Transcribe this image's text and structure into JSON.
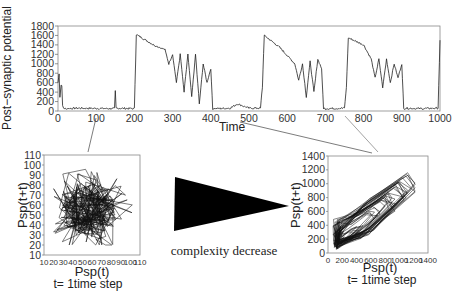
{
  "chart_data": [
    {
      "type": "line",
      "title": "",
      "xlabel": "Time",
      "ylabel": "Post−synaptic potential",
      "xlim": [
        0,
        1000
      ],
      "ylim": [
        0,
        1800
      ],
      "xticks": [
        0,
        100,
        200,
        300,
        400,
        500,
        600,
        700,
        800,
        900,
        1000
      ],
      "yticks": [
        0,
        200,
        400,
        600,
        800,
        1000,
        1200,
        1400,
        1600,
        1800
      ],
      "grid": false,
      "series": [
        {
          "name": "Post-synaptic potential",
          "x": [
            0,
            3,
            5,
            8,
            10,
            12,
            15,
            20,
            50,
            100,
            148,
            150,
            152,
            200,
            205,
            250,
            280,
            290,
            300,
            310,
            320,
            330,
            340,
            350,
            360,
            370,
            380,
            390,
            400,
            405,
            410,
            450,
            470,
            500,
            530,
            535,
            540,
            580,
            620,
            630,
            640,
            650,
            660,
            670,
            680,
            690,
            695,
            700,
            750,
            755,
            760,
            800,
            820,
            830,
            840,
            850,
            860,
            870,
            880,
            890,
            900,
            905,
            910,
            950,
            995,
            1000
          ],
          "values": [
            600,
            800,
            300,
            550,
            550,
            100,
            60,
            50,
            60,
            55,
            50,
            420,
            60,
            50,
            1620,
            1400,
            1300,
            1000,
            1200,
            600,
            1200,
            400,
            1200,
            300,
            1200,
            150,
            1000,
            600,
            900,
            50,
            50,
            60,
            150,
            60,
            60,
            500,
            1600,
            1350,
            1000,
            650,
            1000,
            300,
            1050,
            400,
            1100,
            900,
            60,
            50,
            60,
            500,
            1550,
            1400,
            1100,
            700,
            1100,
            500,
            1100,
            600,
            1000,
            700,
            1000,
            50,
            60,
            50,
            60,
            1500
          ]
        }
      ]
    },
    {
      "type": "line",
      "subtype": "phase-portrait",
      "xlabel": "Psp(t)",
      "ylabel": "Psp(t+t)",
      "caption": "t= 1time step",
      "xlim": [
        10,
        110
      ],
      "ylim": [
        10,
        110
      ],
      "xticks": [
        10,
        20,
        30,
        40,
        50,
        60,
        70,
        80,
        90,
        100,
        110
      ],
      "yticks": [
        10,
        20,
        30,
        40,
        50,
        60,
        70,
        80,
        90,
        100,
        110
      ],
      "description": "dense tangled trajectory centered near (55,55), spanning ~20-100 on both axes"
    },
    {
      "type": "line",
      "subtype": "phase-portrait",
      "xlabel": "Psp(t)",
      "ylabel": "Psp(t+t)",
      "caption": "t= 1time step",
      "xlim": [
        0,
        1400
      ],
      "ylim": [
        0,
        1400
      ],
      "xticks": [
        0,
        200,
        400,
        600,
        800,
        1000,
        1200,
        1400
      ],
      "yticks": [
        0,
        200,
        400,
        600,
        800,
        1000,
        1200,
        1400
      ],
      "description": "looping trajectories forming a wedge from (50,50) to (1200,1200), attractor structure"
    }
  ],
  "annotation": {
    "arrow_label": "complexity decrease"
  },
  "top": {
    "ylabel": "Post−synaptic potential",
    "xlabel": "Time",
    "yticks": [
      "0",
      "200",
      "400",
      "600",
      "800",
      "1000",
      "1200",
      "1400",
      "1600",
      "1800"
    ],
    "xticks": [
      "0",
      "100",
      "200",
      "300",
      "400",
      "500",
      "600",
      "700",
      "800",
      "900",
      "1000"
    ]
  },
  "left": {
    "ylabel": "Psp(t+t)",
    "xlabel": "Psp(t)",
    "caption": "t= 1time step",
    "yticks": [
      "10",
      "20",
      "30",
      "40",
      "50",
      "60",
      "70",
      "80",
      "90",
      "100",
      "110"
    ],
    "xticks": [
      "10",
      "20",
      "30",
      "40",
      "50",
      "60",
      "70",
      "80",
      "90",
      "100",
      "110"
    ]
  },
  "right": {
    "ylabel": "Psp(t+t)",
    "xlabel": "Psp(t)",
    "caption": "t= 1time step",
    "yticks": [
      "0",
      "200",
      "400",
      "600",
      "800",
      "1000",
      "1200",
      "1400"
    ],
    "xticks": [
      "0",
      "200",
      "400",
      "600",
      "800",
      "1000",
      "1200",
      "1400"
    ]
  }
}
